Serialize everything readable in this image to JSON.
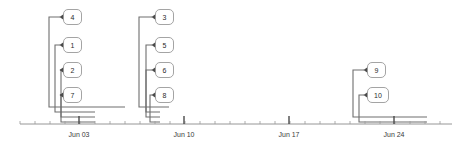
{
  "chart_data": {
    "type": "line",
    "title": "",
    "xlabel": "",
    "ylabel": "",
    "grid": false,
    "legend": null,
    "axis": {
      "orientation": "horizontal",
      "x_start_px": 20,
      "x_end_px": 452,
      "y_px": 124,
      "tick_labels": [
        "Jun 03",
        "Jun 10",
        "Jun 17",
        "Jun 24"
      ],
      "major_tick_x_px": [
        79,
        184,
        289,
        394
      ],
      "minor_tick_spacing_px": 15
    },
    "clusters": [
      {
        "id": "cluster-left",
        "root_x_px": 49,
        "end_x_px": 125,
        "nodes": [
          {
            "label": "4",
            "x_px": 49,
            "y_px": 17,
            "box_x_px": 60,
            "span_end_px": 125
          },
          {
            "label": "1",
            "x_px": 55,
            "y_px": 45,
            "box_x_px": 60,
            "span_end_px": 95
          },
          {
            "label": "2",
            "x_px": 61,
            "y_px": 70,
            "box_x_px": 60,
            "span_end_px": 95
          },
          {
            "label": "7",
            "x_px": 61,
            "y_px": 95,
            "box_x_px": 60,
            "span_end_px": 95
          }
        ]
      },
      {
        "id": "cluster-middle",
        "root_x_px": 139,
        "end_x_px": 169,
        "nodes": [
          {
            "label": "3",
            "x_px": 139,
            "y_px": 17,
            "box_x_px": 152,
            "span_end_px": 169
          },
          {
            "label": "5",
            "x_px": 146,
            "y_px": 45,
            "box_x_px": 152,
            "span_end_px": 160
          },
          {
            "label": "6",
            "x_px": 146,
            "y_px": 70,
            "box_x_px": 152,
            "span_end_px": 160
          },
          {
            "label": "8",
            "x_px": 150,
            "y_px": 95,
            "box_x_px": 152,
            "span_end_px": 160
          }
        ]
      },
      {
        "id": "cluster-right",
        "root_x_px": 353,
        "end_x_px": 427,
        "nodes": [
          {
            "label": "9",
            "x_px": 353,
            "y_px": 70,
            "box_x_px": 364,
            "span_end_px": 427
          },
          {
            "label": "10",
            "x_px": 359,
            "y_px": 95,
            "box_x_px": 364,
            "span_end_px": 427
          }
        ]
      }
    ]
  }
}
